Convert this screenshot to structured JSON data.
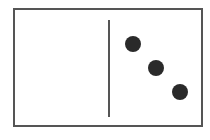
{
  "domino": {
    "left_half_pips": 0,
    "right_half_pips": 3,
    "colors": {
      "border": "#555555",
      "pip": "#2a2a2a",
      "background": "#ffffff"
    },
    "pips": [
      {
        "cx": 133,
        "cy": 44
      },
      {
        "cx": 156,
        "cy": 68
      },
      {
        "cx": 180,
        "cy": 92
      }
    ]
  }
}
